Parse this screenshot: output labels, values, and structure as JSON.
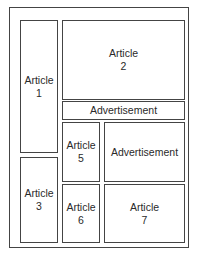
{
  "diagram": {
    "title": "",
    "blocks": [
      {
        "id": "article-1",
        "label": "Article",
        "number": "1"
      },
      {
        "id": "article-2",
        "label": "Article",
        "number": "2"
      },
      {
        "id": "ad-banner",
        "label": "Advertisement"
      },
      {
        "id": "article-3",
        "label": "Article",
        "number": "3"
      },
      {
        "id": "article-5",
        "label": "Article",
        "number": "5"
      },
      {
        "id": "ad-box",
        "label": "Advertisement"
      },
      {
        "id": "article-6",
        "label": "Article",
        "number": "6"
      },
      {
        "id": "article-7",
        "label": "Article",
        "number": "7"
      }
    ]
  }
}
